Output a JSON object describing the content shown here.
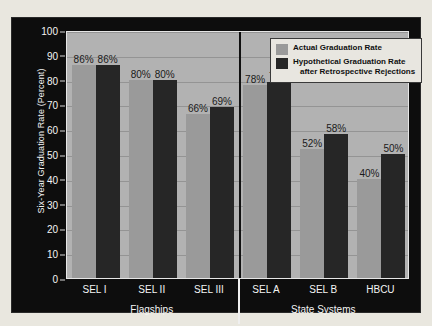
{
  "chart_data": {
    "type": "bar",
    "title": "",
    "xlabel": "",
    "ylabel": "Six-Year Graduation Rate (Percent)",
    "ylim": [
      0,
      100
    ],
    "ytick_step": 10,
    "grid": true,
    "legend_position": "top-right",
    "yticks": [
      "100",
      "90",
      "80",
      "70",
      "60",
      "50",
      "40",
      "30",
      "20",
      "10",
      "0"
    ],
    "ytick_values": [
      100,
      90,
      80,
      70,
      60,
      50,
      40,
      30,
      20,
      10,
      0
    ],
    "categories": [
      "SEL I",
      "SEL II",
      "SEL III",
      "SEL A",
      "SEL B",
      "HBCU"
    ],
    "groups": [
      {
        "name": "Flagships",
        "categories": [
          "SEL I",
          "SEL II",
          "SEL III"
        ]
      },
      {
        "name": "State Systems",
        "categories": [
          "SEL A",
          "SEL B",
          "HBCU"
        ]
      }
    ],
    "series": [
      {
        "name": "Actual Graduation Rate",
        "color": "#9a9a9a",
        "values": [
          86,
          80,
          66,
          78,
          52,
          40
        ],
        "labels": [
          "86%",
          "80%",
          "66%",
          "78%",
          "52%",
          "40%"
        ]
      },
      {
        "name": "Hypothetical Graduation Rate after Retrospective Rejections",
        "color": "#262626",
        "values": [
          86,
          80,
          69,
          79,
          58,
          50
        ],
        "labels": [
          "86%",
          "80%",
          "69%",
          "79%",
          "58%",
          "50%"
        ]
      }
    ]
  },
  "legend": {
    "entries": [
      {
        "line1": "Actual Graduation Rate",
        "line2": ""
      },
      {
        "line1": "Hypothetical Graduation Rate",
        "line2": "after Retrospective Rejections"
      }
    ]
  },
  "colors": {
    "page_background": "#e9e7df",
    "panel_background": "#0d0d0d",
    "plot_background": "#b2b2b2",
    "gridline": "#949494",
    "actual_bar": "#9a9a9a",
    "hypothetical_bar": "#262626",
    "axis_text": "#f4f4f4",
    "legend_background": "#e8e6e0"
  }
}
